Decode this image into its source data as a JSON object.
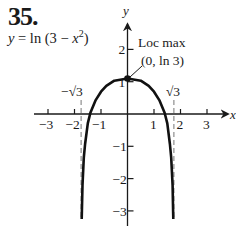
{
  "problem": {
    "number": "35.",
    "equation_prefix": "y",
    "equation_mid": " = ln (3 − ",
    "equation_var": "x",
    "equation_exp": "2",
    "equation_suffix": ")"
  },
  "chart_data": {
    "type": "line",
    "title": "35.",
    "function": "y = ln(3 − x²)",
    "xlabel": "x",
    "ylabel": "y",
    "xlim": [
      -3.5,
      3.8
    ],
    "ylim": [
      -3.5,
      3
    ],
    "grid": false,
    "legend": null,
    "x_ticks": [
      -3,
      -2,
      -1,
      1,
      2,
      3
    ],
    "x_tick_labels": [
      "−3",
      "−2",
      "−1",
      "1",
      "2",
      "3"
    ],
    "y_ticks": [
      2,
      1,
      -1,
      -2,
      -3
    ],
    "y_tick_labels": [
      "2",
      "1",
      "−1",
      "−2",
      "−3"
    ],
    "asymptotes": [
      {
        "x": -1.732,
        "label": "−√3",
        "style": "dashed"
      },
      {
        "x": 1.732,
        "label": "√3",
        "style": "dashed"
      }
    ],
    "x_intercepts": [
      -1.414,
      1.414
    ],
    "series": [
      {
        "name": "y = ln(3 − x²)",
        "x": [
          -1.728,
          -1.72,
          -1.7,
          -1.65,
          -1.6,
          -1.5,
          -1.4,
          -1.2,
          -1.0,
          -0.8,
          -0.5,
          0,
          0.5,
          0.8,
          1.0,
          1.2,
          1.4,
          1.5,
          1.6,
          1.65,
          1.7,
          1.72,
          1.728
        ],
        "y": [
          -3.3,
          -3.0,
          -2.2,
          -1.35,
          -0.93,
          -0.29,
          0.04,
          0.43,
          0.69,
          0.87,
          1.03,
          1.0986,
          1.03,
          0.87,
          0.69,
          0.43,
          0.04,
          -0.29,
          -0.93,
          -1.35,
          -2.2,
          -3.0,
          -3.3
        ]
      }
    ],
    "annotations": [
      {
        "text": "Loc max",
        "x": 0,
        "y": 1.0986
      },
      {
        "text": "(0, ln 3)",
        "x": 0,
        "y": 1.0986
      }
    ],
    "key_points": [
      {
        "label": "Loc max",
        "x": 0,
        "y": 1.0986
      }
    ]
  }
}
